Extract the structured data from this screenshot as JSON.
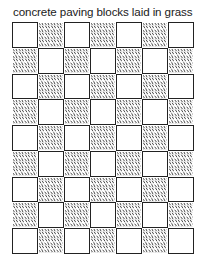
{
  "caption": "concrete paving blocks laid in grass",
  "diagram": {
    "type": "checkerboard-paving",
    "columns": 7,
    "rows": 9,
    "first_cell": "block",
    "cell_types": {
      "block": "concrete paving block (blank square with outline)",
      "grass": "grass-filled gap (hatched)"
    },
    "colors": {
      "line": "#222222",
      "background": "#ffffff",
      "hatch": "#333333"
    }
  }
}
